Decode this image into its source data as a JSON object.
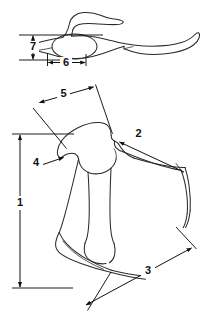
{
  "figure": {
    "background_color": "#ffffff",
    "line_color": "#2b2b2b",
    "dimension_color": "#111111",
    "views": [
      {
        "name": "upper-view",
        "label": "dorsal / superior outline with winged process and elongate process"
      },
      {
        "name": "lower-view",
        "label": "lateral outline with articular head and distal curved extremity"
      }
    ],
    "dimensions": [
      {
        "id": "dim-1",
        "label": "1",
        "orientation": "vertical",
        "kind": "double-arrow",
        "view": "lower-view",
        "label_x": 20,
        "label_y": 203
      },
      {
        "id": "dim-2",
        "label": "2",
        "orientation": "diagonal",
        "kind": "leader-arrow",
        "view": "lower-view",
        "label_x": 139,
        "label_y": 134
      },
      {
        "id": "dim-3",
        "label": "3",
        "orientation": "diagonal",
        "kind": "double-arrow",
        "view": "lower-view",
        "label_x": 148,
        "label_y": 271
      },
      {
        "id": "dim-4",
        "label": "4",
        "orientation": "horizontal",
        "kind": "leader-arrow",
        "view": "lower-view",
        "label_x": 36,
        "label_y": 163
      },
      {
        "id": "dim-5",
        "label": "5",
        "orientation": "diagonal",
        "kind": "double-arrow",
        "view": "lower-view",
        "label_x": 63,
        "label_y": 94
      },
      {
        "id": "dim-6",
        "label": "6",
        "orientation": "horizontal",
        "kind": "double-arrow",
        "view": "upper-view",
        "label_x": 66,
        "label_y": 63
      },
      {
        "id": "dim-7",
        "label": "7",
        "orientation": "vertical",
        "kind": "double-arrow",
        "view": "upper-view",
        "label_x": 33,
        "label_y": 47
      }
    ]
  }
}
